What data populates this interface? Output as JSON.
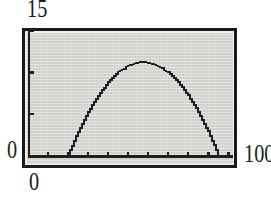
{
  "figure": {
    "labels": {
      "y_max": "15",
      "y_origin": "0",
      "x_origin": "0",
      "x_max": "100"
    }
  },
  "colors": {
    "ink": "#1f1f1f",
    "screen_bg": "#d6d5d2",
    "frame_border": "#1a1a1a",
    "page_bg": "#ffffff"
  },
  "chart_data": {
    "type": "line",
    "title": "",
    "xlabel": "",
    "ylabel": "",
    "window": {
      "xmin": 0,
      "xmax": 100,
      "xscl": 10,
      "ymin": 0,
      "ymax": 15,
      "yscl": 5
    },
    "axis_tick_labels": {
      "x": [
        "0",
        "100"
      ],
      "y": [
        "0",
        "15"
      ]
    },
    "grid": false,
    "legend": false,
    "series": [
      {
        "name": "parabolic-arc",
        "points": [
          [
            20,
            0
          ],
          [
            25,
            2.8
          ],
          [
            30,
            5.2
          ],
          [
            35,
            7.2
          ],
          [
            40,
            8.8
          ],
          [
            45,
            10.0
          ],
          [
            50,
            10.8
          ],
          [
            55,
            11.2
          ],
          [
            57.5,
            11.25
          ],
          [
            60,
            11.2
          ],
          [
            65,
            10.8
          ],
          [
            70,
            10.0
          ],
          [
            75,
            8.8
          ],
          [
            80,
            7.2
          ],
          [
            85,
            5.2
          ],
          [
            90,
            2.8
          ],
          [
            95,
            0
          ]
        ]
      }
    ]
  }
}
